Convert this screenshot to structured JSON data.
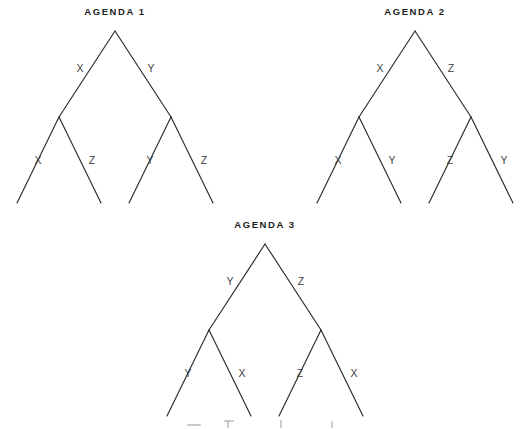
{
  "style": {
    "background": "#ffffff",
    "line_color": "#2b2b2b",
    "label_color": "#3f3f3f",
    "title_color": "#1d1d1d"
  },
  "trees": [
    {
      "title": "AGENDA 1",
      "labels": {
        "root_left": "X",
        "root_right": "Y",
        "left_child_left": "X",
        "left_child_right": "Z",
        "right_child_left": "Y",
        "right_child_right": "Z"
      }
    },
    {
      "title": "AGENDA 2",
      "labels": {
        "root_left": "X",
        "root_right": "Z",
        "left_child_left": "X",
        "left_child_right": "Y",
        "right_child_left": "Z",
        "right_child_right": "Y"
      }
    },
    {
      "title": "AGENDA 3",
      "labels": {
        "root_left": "Y",
        "root_right": "Z",
        "left_child_left": "Y",
        "left_child_right": "X",
        "right_child_left": "Z",
        "right_child_right": "X"
      }
    }
  ]
}
